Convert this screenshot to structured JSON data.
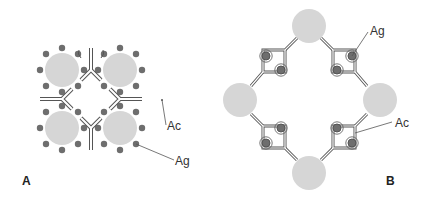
{
  "figure": {
    "panels": [
      {
        "id": "A",
        "label": "A",
        "labels": {
          "antibody": "Ac",
          "antigen": "Ag"
        }
      },
      {
        "id": "B",
        "label": "B",
        "labels": {
          "antibody": "Ac",
          "antigen": "Ag"
        }
      }
    ]
  },
  "colors": {
    "particle": "#d6d6d6",
    "antigen": "#6e6e6e",
    "antibody_outline": "#555555",
    "antibody_fill": "#ffffff",
    "label": "#333333"
  }
}
